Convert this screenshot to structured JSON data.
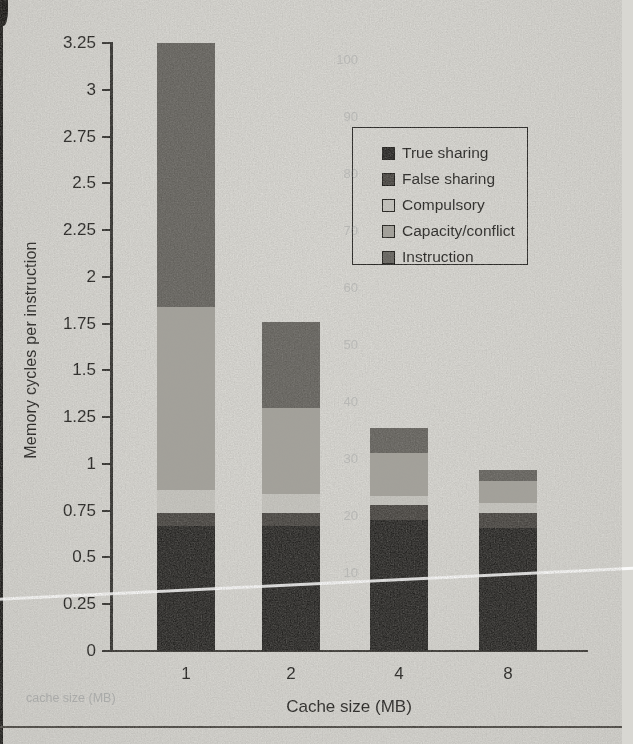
{
  "figure": {
    "paper_color": "#d8d7d2",
    "axis_color": "#2b2a27",
    "text_color": "#1b1a18"
  },
  "chart_data": {
    "type": "bar",
    "subtype": "stacked-vertical",
    "title": "",
    "xlabel": "Cache size (MB)",
    "ylabel": "Memory cycles per instruction",
    "categories": [
      "1",
      "2",
      "4",
      "8"
    ],
    "series": [
      {
        "name": "True sharing",
        "color": "#21201e",
        "values": [
          0.67,
          0.67,
          0.7,
          0.66
        ]
      },
      {
        "name": "False sharing",
        "color": "#423f3b",
        "values": [
          0.07,
          0.07,
          0.08,
          0.08
        ]
      },
      {
        "name": "Compulsory",
        "color": "#c8c7c1",
        "values": [
          0.12,
          0.1,
          0.05,
          0.05
        ]
      },
      {
        "name": "Capacity/conflict",
        "color": "#a3a19a",
        "values": [
          0.98,
          0.46,
          0.23,
          0.12
        ]
      },
      {
        "name": "Instruction",
        "color": "#605e59",
        "values": [
          1.41,
          0.46,
          0.13,
          0.06
        ]
      }
    ],
    "totals": [
      3.25,
      1.76,
      1.19,
      0.97
    ],
    "ylim": [
      0,
      3.25
    ],
    "y_ticks": [
      "0",
      "0.25",
      "0.5",
      "0.75",
      "1",
      "1.25",
      "1.5",
      "1.75",
      "2",
      "2.25",
      "2.5",
      "2.75",
      "3",
      "3.25"
    ],
    "grid": "off",
    "legend_position": "upper-right-box",
    "stack_order_bottom_to_top": [
      "True sharing",
      "False sharing",
      "Compulsory",
      "Capacity/conflict",
      "Instruction"
    ]
  },
  "ghosts": {
    "axis_numbers": [
      "100",
      "90",
      "80",
      "70",
      "60",
      "50",
      "40",
      "30",
      "20",
      "10"
    ],
    "bottom_text": "cache size (MB)"
  }
}
